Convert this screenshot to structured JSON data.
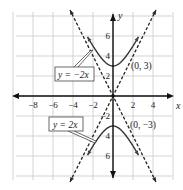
{
  "chart_data": {
    "type": "line",
    "title": "",
    "xlabel": "x",
    "ylabel": "y",
    "xlim": [
      -10,
      6
    ],
    "ylim": [
      -8,
      8
    ],
    "grid": true,
    "grid_step": 2,
    "x_ticks": [
      {
        "value": -8,
        "label": "−8"
      },
      {
        "value": -6,
        "label": "−6"
      },
      {
        "value": -4,
        "label": "−4"
      },
      {
        "value": -2,
        "label": "−2"
      },
      {
        "value": 2,
        "label": "2"
      },
      {
        "value": 4,
        "label": "4"
      }
    ],
    "y_ticks": [
      {
        "value": 6,
        "label": "6"
      },
      {
        "value": 4,
        "label": "4"
      },
      {
        "value": 2,
        "label": "2"
      },
      {
        "value": -2,
        "label": "−2"
      },
      {
        "value": -4,
        "label": "4"
      },
      {
        "value": -6,
        "label": "6"
      }
    ],
    "series": [
      {
        "name": "hyperbola upper branch",
        "equation": "y^2/9 - x^2/(9/4) = 1",
        "style": "solid",
        "vertex": [
          0,
          3
        ]
      },
      {
        "name": "hyperbola lower branch",
        "equation": "y^2/9 - x^2/(9/4) = 1",
        "style": "solid",
        "vertex": [
          0,
          -3
        ]
      },
      {
        "name": "y = 2x",
        "slope": 2,
        "style": "dashed"
      },
      {
        "name": "y = -2x",
        "slope": -2,
        "style": "dashed"
      }
    ],
    "annotations": [
      {
        "text": "(0, 3)",
        "at": [
          0,
          3
        ]
      },
      {
        "text": "(0, −3)",
        "at": [
          0,
          -3
        ]
      },
      {
        "text": "y = −2x",
        "callout_for": "y = -2x"
      },
      {
        "text": "y = 2x",
        "callout_for": "y = 2x"
      }
    ]
  }
}
